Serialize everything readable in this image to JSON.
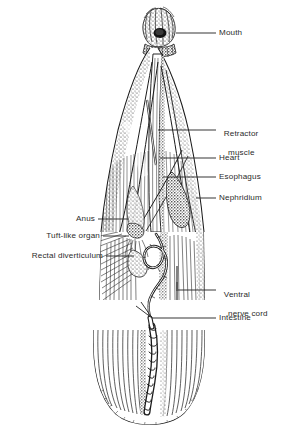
{
  "figure": {
    "organism": "echiuran worm",
    "view": "dissected longitudinal view",
    "ink_color": "#1a1a1a",
    "background_color": "#ffffff",
    "label_color": "#2b2b2b"
  },
  "labels": {
    "mouth": "Mouth",
    "retractor_muscle_line1": "Retractor",
    "retractor_muscle_line2": "muscle",
    "heart": "Heart",
    "esophagus": "Esophagus",
    "nephridium": "Nephridium",
    "anus": "Anus",
    "tuft_like_organ": "Tuft-like organ",
    "rectal_diverticulum": "Rectal diverticulum",
    "ventral_nerve_cord_line1": "Ventral",
    "ventral_nerve_cord_line2": "nerve cord",
    "intestine": "Intestine"
  },
  "structures": [
    "mouth",
    "retractor muscle",
    "heart",
    "esophagus",
    "nephridium",
    "anus",
    "tuft-like organ",
    "rectal diverticulum",
    "ventral nerve cord",
    "intestine"
  ]
}
